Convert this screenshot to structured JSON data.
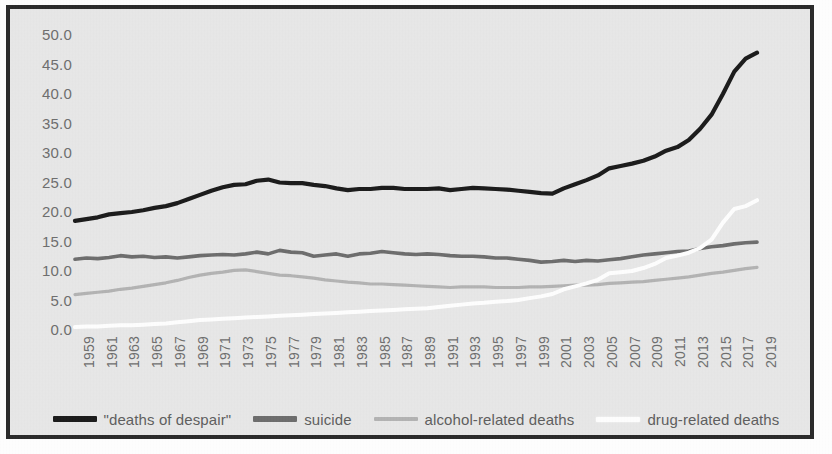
{
  "figure": {
    "background_color": "#e8e8e8",
    "border_color": "#2b2b2b",
    "axis_text_color": "#6f6f6f"
  },
  "chart_data": {
    "type": "line",
    "title": "",
    "subtitle": "",
    "xlabel": "",
    "ylabel": "",
    "xlim": [
      1959,
      2019
    ],
    "ylim": [
      0.0,
      50.0
    ],
    "ytick_step": 5.0,
    "grid": false,
    "legend_position": "bottom",
    "ytick_labels": [
      "50.0",
      "45.0",
      "40.0",
      "35.0",
      "30.0",
      "25.0",
      "20.0",
      "15.0",
      "10.0",
      "5.0",
      "0.0"
    ],
    "ytick_values": [
      50.0,
      45.0,
      40.0,
      35.0,
      30.0,
      25.0,
      20.0,
      15.0,
      10.0,
      5.0,
      0.0
    ],
    "xtick_labels": [
      "1959",
      "1961",
      "1963",
      "1965",
      "1967",
      "1969",
      "1971",
      "1973",
      "1975",
      "1977",
      "1979",
      "1981",
      "1983",
      "1985",
      "1987",
      "1989",
      "1991",
      "1993",
      "1995",
      "1997",
      "1999",
      "2001",
      "2003",
      "2005",
      "2007",
      "2009",
      "2011",
      "2013",
      "2015",
      "2017",
      "2019"
    ],
    "x": [
      1959,
      1960,
      1961,
      1962,
      1963,
      1964,
      1965,
      1966,
      1967,
      1968,
      1969,
      1970,
      1971,
      1972,
      1973,
      1974,
      1975,
      1976,
      1977,
      1978,
      1979,
      1980,
      1981,
      1982,
      1983,
      1984,
      1985,
      1986,
      1987,
      1988,
      1989,
      1990,
      1991,
      1992,
      1993,
      1994,
      1995,
      1996,
      1997,
      1998,
      1999,
      2000,
      2001,
      2002,
      2003,
      2004,
      2005,
      2006,
      2007,
      2008,
      2009,
      2010,
      2011,
      2012,
      2013,
      2014,
      2015,
      2016,
      2017,
      2018,
      2019
    ],
    "series": [
      {
        "name": "\"deaths of despair\"",
        "color": "#1c1c1c",
        "width": 4.2,
        "values": [
          18.5,
          18.8,
          19.1,
          19.6,
          19.8,
          20.0,
          20.3,
          20.7,
          21.0,
          21.5,
          22.2,
          22.9,
          23.6,
          24.2,
          24.6,
          24.7,
          25.3,
          25.5,
          25.0,
          24.9,
          24.9,
          24.6,
          24.4,
          24.0,
          23.7,
          23.9,
          23.9,
          24.1,
          24.1,
          23.9,
          23.9,
          23.9,
          24.0,
          23.7,
          23.9,
          24.1,
          24.0,
          23.9,
          23.8,
          23.6,
          23.4,
          23.2,
          23.1,
          24.0,
          24.7,
          25.4,
          26.2,
          27.4,
          27.8,
          28.2,
          28.7,
          29.4,
          30.4,
          31.0,
          32.2,
          34.1,
          36.5,
          40.0,
          43.8,
          46.0,
          47.0
        ]
      },
      {
        "name": "suicide",
        "color": "#6e6e6e",
        "width": 3.6,
        "values": [
          12.0,
          12.2,
          12.1,
          12.3,
          12.6,
          12.4,
          12.5,
          12.3,
          12.4,
          12.2,
          12.4,
          12.6,
          12.7,
          12.8,
          12.7,
          12.9,
          13.2,
          12.9,
          13.5,
          13.2,
          13.1,
          12.5,
          12.7,
          12.9,
          12.5,
          12.9,
          13.0,
          13.3,
          13.1,
          12.9,
          12.8,
          12.9,
          12.8,
          12.6,
          12.5,
          12.5,
          12.4,
          12.2,
          12.2,
          12.0,
          11.8,
          11.5,
          11.6,
          11.8,
          11.6,
          11.8,
          11.7,
          11.9,
          12.1,
          12.4,
          12.7,
          12.9,
          13.1,
          13.3,
          13.4,
          13.8,
          14.1,
          14.3,
          14.6,
          14.8,
          14.9
        ]
      },
      {
        "name": "alcohol-related deaths",
        "color": "#b4b4b4",
        "width": 3.2,
        "values": [
          6.0,
          6.2,
          6.4,
          6.6,
          6.9,
          7.1,
          7.4,
          7.7,
          8.0,
          8.4,
          8.9,
          9.3,
          9.6,
          9.8,
          10.1,
          10.2,
          9.9,
          9.6,
          9.3,
          9.2,
          9.0,
          8.8,
          8.5,
          8.3,
          8.1,
          8.0,
          7.8,
          7.8,
          7.7,
          7.6,
          7.5,
          7.4,
          7.3,
          7.2,
          7.3,
          7.3,
          7.3,
          7.2,
          7.2,
          7.2,
          7.3,
          7.3,
          7.4,
          7.5,
          7.6,
          7.6,
          7.7,
          7.9,
          8.0,
          8.1,
          8.2,
          8.4,
          8.6,
          8.8,
          9.0,
          9.3,
          9.6,
          9.8,
          10.1,
          10.4,
          10.6
        ]
      },
      {
        "name": "drug-related deaths",
        "color": "#ffffff",
        "width": 4.0,
        "values": [
          0.5,
          0.6,
          0.6,
          0.7,
          0.8,
          0.8,
          0.9,
          1.0,
          1.1,
          1.3,
          1.5,
          1.7,
          1.8,
          1.9,
          2.0,
          2.1,
          2.2,
          2.3,
          2.4,
          2.5,
          2.6,
          2.7,
          2.8,
          2.9,
          3.0,
          3.1,
          3.2,
          3.3,
          3.4,
          3.5,
          3.6,
          3.7,
          3.9,
          4.1,
          4.3,
          4.5,
          4.6,
          4.8,
          4.9,
          5.1,
          5.4,
          5.7,
          6.1,
          6.9,
          7.4,
          7.9,
          8.5,
          9.6,
          9.8,
          10.0,
          10.5,
          11.2,
          12.2,
          12.6,
          13.1,
          13.9,
          15.3,
          18.2,
          20.5,
          21.0,
          22.0
        ]
      }
    ],
    "legend": [
      {
        "label": "\"deaths of despair\"",
        "color": "#1c1c1c"
      },
      {
        "label": "suicide",
        "color": "#6e6e6e"
      },
      {
        "label": "alcohol-related deaths",
        "color": "#b4b4b4"
      },
      {
        "label": "drug-related deaths",
        "color": "#ffffff"
      }
    ]
  }
}
